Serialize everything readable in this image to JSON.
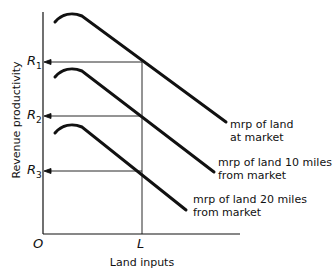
{
  "chart_data": {
    "type": "line",
    "title": "",
    "xlabel": "Land inputs",
    "ylabel": "Revenue productivity",
    "origin_label": "O",
    "x_ticks": [
      {
        "label": "L",
        "x": 142
      }
    ],
    "y_ticks": [
      {
        "label": "R",
        "sub": "1",
        "y": 62
      },
      {
        "label": "R",
        "sub": "2",
        "y": 116
      },
      {
        "label": "R",
        "sub": "3",
        "y": 171
      }
    ],
    "series": [
      {
        "name": "mrp of land at market",
        "label_lines": [
          "mrp of land",
          "at market"
        ],
        "path": "M55,22 C62,14 72,12 82,16 L226,122",
        "label_x": 230,
        "label_y": [
          128,
          141
        ]
      },
      {
        "name": "mrp of land 10 miles from market",
        "label_lines": [
          "mrp of land 10 miles",
          "from market"
        ],
        "path": "M55,77 C62,69 72,67 82,71 L214,172",
        "label_x": 218,
        "label_y": [
          166,
          179
        ]
      },
      {
        "name": "mrp of land 20 miles from market",
        "label_lines": [
          "mrp of land 20 miles",
          "from market"
        ],
        "path": "M55,133 C62,125 72,123 82,127 L186,210",
        "label_x": 193,
        "label_y": [
          203,
          216
        ]
      }
    ],
    "grid": false,
    "legend": "inline labels at curve ends"
  },
  "colors": {
    "ink": "#111111",
    "background": "#ffffff"
  }
}
